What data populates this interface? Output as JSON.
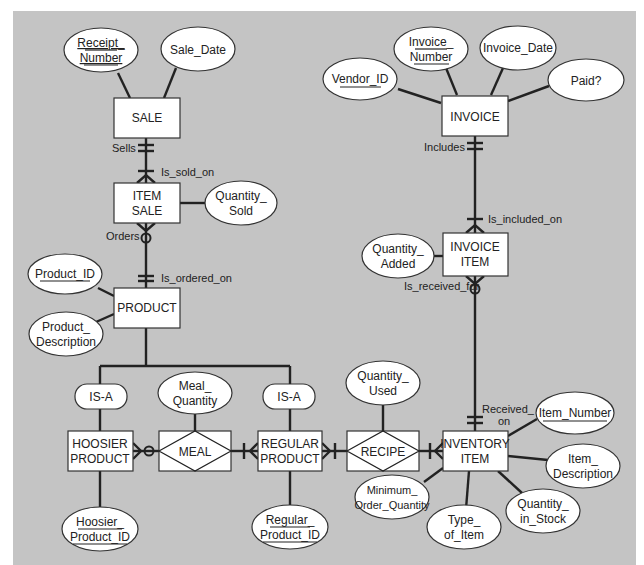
{
  "colors": {
    "panel": "#c4c4c4",
    "line": "#222222",
    "fill": "#ffffff",
    "page": "#ffffff"
  },
  "entities": {
    "sale": "SALE",
    "item_sale": [
      "ITEM",
      "SALE"
    ],
    "product": "PRODUCT",
    "hoosier_product": [
      "HOOSIER",
      "PRODUCT"
    ],
    "regular_product": [
      "REGULAR",
      "PRODUCT"
    ],
    "invoice": "INVOICE",
    "invoice_item": [
      "INVOICE",
      "ITEM"
    ],
    "inventory_item": [
      "INVENTORY",
      "ITEM"
    ]
  },
  "associative": {
    "meal": "MEAL",
    "recipe": "RECIPE"
  },
  "attributes": {
    "receipt_number": [
      "Receipt_",
      "Number"
    ],
    "sale_date": "Sale_Date",
    "quantity_sold": [
      "Quantity_",
      "Sold"
    ],
    "product_id": "Product_ID",
    "product_description": [
      "Product_",
      "Description"
    ],
    "meal_quantity": [
      "Meal_",
      "Quantity"
    ],
    "hoosier_product_id": [
      "Hoosier_",
      "Product_ID"
    ],
    "regular_product_id": [
      "Regular_",
      "Product_ID"
    ],
    "vendor_id": "Vendor_ID",
    "invoice_number": [
      "Invoice_",
      "Number"
    ],
    "invoice_date": "Invoice_Date",
    "paid": "Paid?",
    "quantity_added": [
      "Quantity_",
      "Added"
    ],
    "quantity_used": [
      "Quantity_",
      "Used"
    ],
    "item_number": "Item_Number",
    "item_description": [
      "Item_",
      "Description"
    ],
    "quantity_in_stock": [
      "Quantity_",
      "in_Stock"
    ],
    "type_of_item": [
      "Type_",
      "of_Item"
    ],
    "minimum_order_quantity": [
      "Minimum_",
      "Order_Quantity"
    ]
  },
  "subtypes": {
    "isa_left": "IS-A",
    "isa_right": "IS-A"
  },
  "relationship_labels": {
    "sells": "Sells",
    "is_sold_on": "Is_sold_on",
    "orders": "Orders",
    "is_ordered_on": "Is_ordered_on",
    "includes": "Includes",
    "is_included_on": "Is_included_on",
    "is_received_for": "Is_received_for",
    "received_on": [
      "Received_",
      "on"
    ]
  }
}
